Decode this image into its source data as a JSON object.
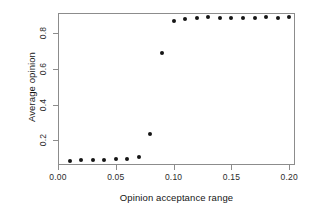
{
  "chart_data": {
    "type": "scatter",
    "title": "",
    "xlabel": "Opinion acceptance range",
    "ylabel": "Average opinion",
    "xlim": [
      0.0,
      0.205
    ],
    "ylim": [
      0.06,
      0.915
    ],
    "grid": false,
    "legend": null,
    "xticks": [
      "0.00",
      "0.05",
      "0.10",
      "0.15",
      "0.20"
    ],
    "xtickvalues": [
      0.0,
      0.05,
      0.1,
      0.15,
      0.2
    ],
    "yticks": [
      "0.2",
      "0.4",
      "0.6",
      "0.8"
    ],
    "ytickvalues": [
      0.2,
      0.4,
      0.6,
      0.8
    ],
    "marker": "filled-circle",
    "marker_color": "#151515",
    "frame_color": "#8c8c8c",
    "background": "#ffffff",
    "x": [
      0.01,
      0.02,
      0.03,
      0.04,
      0.05,
      0.06,
      0.07,
      0.08,
      0.09,
      0.1,
      0.11,
      0.12,
      0.13,
      0.14,
      0.15,
      0.16,
      0.17,
      0.18,
      0.19,
      0.2
    ],
    "y": [
      0.085,
      0.086,
      0.09,
      0.09,
      0.095,
      0.092,
      0.105,
      0.235,
      0.69,
      0.868,
      0.883,
      0.886,
      0.89,
      0.889,
      0.889,
      0.888,
      0.889,
      0.891,
      0.889,
      0.89
    ]
  }
}
